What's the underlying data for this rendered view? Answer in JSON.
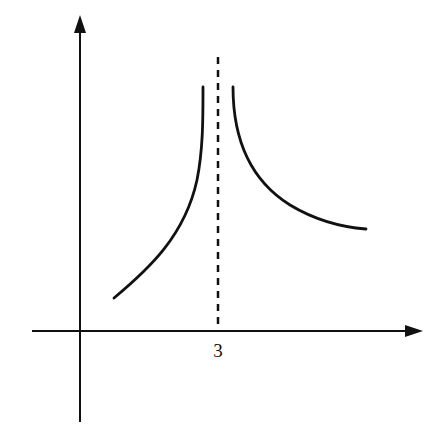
{
  "figure": {
    "colors": {
      "curve": "#111111",
      "axes": "#111111",
      "asymptote": "#111111",
      "background": "#ffffff"
    }
  },
  "axes": {
    "x_axis": {
      "label": "",
      "arrow": "right"
    },
    "y_axis": {
      "label": "",
      "arrow": "up"
    },
    "x_tick_labels": [
      "3"
    ]
  },
  "asymptote": {
    "type": "vertical",
    "x": 3,
    "style": "dashed"
  },
  "curves": [
    {
      "name": "left-branch",
      "domain": "x < 3",
      "behavior": "increasing, to +infinity as x approaches 3 from left"
    },
    {
      "name": "right-branch",
      "domain": "x > 3",
      "behavior": "decreasing from +infinity, leveling off toward a horizontal value"
    }
  ]
}
